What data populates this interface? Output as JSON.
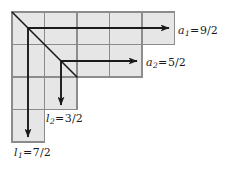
{
  "figure": {
    "kind": "young-diagram-hook-lengths",
    "colors": {
      "cell_fill": "#e6e6e6",
      "grid_line": "#8c8c8c",
      "outline": "#8c8c8c",
      "arrow": "#1a1a1a",
      "diagonal": "#1a1a1a",
      "background": "#ffffff",
      "text": "#1a1a1a"
    },
    "geometry": {
      "cell_size": 32.5,
      "origin_x": 12,
      "origin_y": 12,
      "row_lengths": [
        5,
        4,
        2,
        2,
        1
      ]
    },
    "diagonal": {
      "from": [
        12,
        12
      ],
      "to": [
        77,
        77
      ]
    },
    "hooks": [
      {
        "id": "hook-1",
        "origin_cell": [
          0,
          0
        ],
        "arm_label": "a",
        "arm_sub": "1",
        "arm_value": "9/2",
        "leg_label": "l",
        "leg_sub": "1",
        "leg_value": "7/2",
        "arm_arrow": {
          "x1": 28,
          "y1": 28,
          "x2": 172,
          "y2": 28
        },
        "leg_arrow": {
          "x1": 28,
          "y1": 28,
          "x2": 28,
          "y2": 140
        }
      },
      {
        "id": "hook-2",
        "origin_cell": [
          1,
          1
        ],
        "arm_label": "a",
        "arm_sub": "2",
        "arm_value": "5/2",
        "leg_label": "l",
        "leg_sub": "2",
        "leg_value": "3/2",
        "arm_arrow": {
          "x1": 61,
          "y1": 61,
          "x2": 140,
          "y2": 61
        },
        "leg_arrow": {
          "x1": 61,
          "y1": 61,
          "x2": 61,
          "y2": 108
        }
      }
    ],
    "labels": {
      "a1": {
        "var": "a",
        "sub": "1",
        "eq": "=",
        "value": "9/2"
      },
      "a2": {
        "var": "a",
        "sub": "2",
        "eq": "=",
        "value": "5/2"
      },
      "l2": {
        "var": "l",
        "sub": "2",
        "eq": "=",
        "value": "3/2"
      },
      "l1": {
        "var": "l",
        "sub": "1",
        "eq": "=",
        "value": "7/2"
      }
    }
  }
}
